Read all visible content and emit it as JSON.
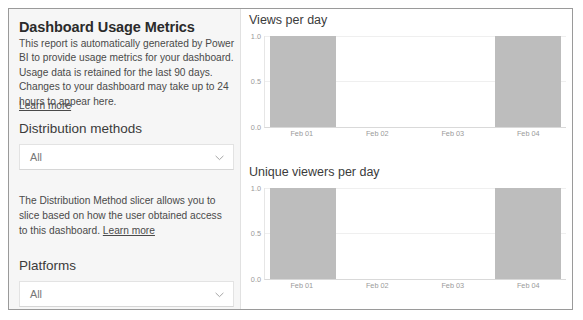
{
  "panel": {
    "title": "Dashboard Usage Metrics",
    "description": "This report is automatically generated by Power BI to provide usage metrics for your dashboard. Usage data is retained for the last 90 days. Changes to your dashboard may take up to 24 hours to appear here.",
    "learn_more": "Learn more",
    "distribution": {
      "heading": "Distribution methods",
      "slicer_value": "All",
      "slicer_icon": "chevron-down-icon",
      "helper_text_before_link": "The Distribution Method slicer allows you to slice based on how the user obtained access to this dashboard. ",
      "helper_link": "Learn more"
    },
    "platforms": {
      "heading": "Platforms",
      "slicer_value": "All",
      "slicer_icon": "chevron-down-icon"
    }
  },
  "chart_data": [
    {
      "type": "bar",
      "title": "Views per day",
      "categories": [
        "Feb 01",
        "Feb 02",
        "Feb 03",
        "Feb 04"
      ],
      "values": [
        1.0,
        0.0,
        0.0,
        1.0
      ],
      "xlabel": "",
      "ylabel": "",
      "ylim": [
        0.0,
        1.0
      ],
      "yticks": [
        "1.0",
        "0.5",
        "0.0"
      ],
      "grid": true,
      "legend": "none",
      "bar_color": "#bdbdbd"
    },
    {
      "type": "bar",
      "title": "Unique viewers per day",
      "categories": [
        "Feb 01",
        "Feb 02",
        "Feb 03",
        "Feb 04"
      ],
      "values": [
        1.0,
        0.0,
        0.0,
        1.0
      ],
      "xlabel": "",
      "ylabel": "",
      "ylim": [
        0.0,
        1.0
      ],
      "yticks": [
        "1.0",
        "0.5",
        "0.0"
      ],
      "grid": true,
      "legend": "none",
      "bar_color": "#bdbdbd"
    }
  ]
}
